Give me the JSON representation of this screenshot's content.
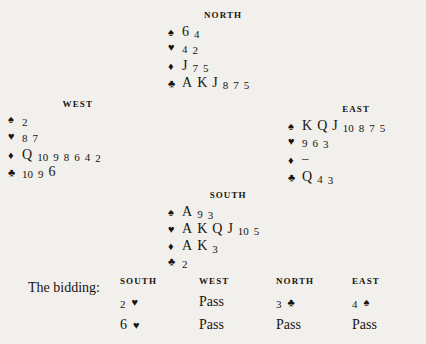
{
  "page": {
    "background_color": "#f2f0ec",
    "text_color": "#17140f"
  },
  "suits": {
    "spade": "♠",
    "heart": "♥",
    "diamond": "♦",
    "club": "♣",
    "void": "–"
  },
  "hands": {
    "north": {
      "label": "NORTH",
      "spades": [
        "6",
        "4"
      ],
      "hearts": [
        "4",
        "2"
      ],
      "diamonds": [
        "J",
        "7",
        "5"
      ],
      "clubs": [
        "A",
        "K",
        "J",
        "8",
        "7",
        "5"
      ]
    },
    "west": {
      "label": "WEST",
      "spades": [
        "2"
      ],
      "hearts": [
        "8",
        "7"
      ],
      "diamonds": [
        "Q",
        "10",
        "9",
        "8",
        "6",
        "4",
        "2"
      ],
      "clubs": [
        "10",
        "9",
        "6"
      ]
    },
    "east": {
      "label": "EAST",
      "spades": [
        "K",
        "Q",
        "J",
        "10",
        "8",
        "7",
        "5"
      ],
      "hearts": [
        "9",
        "6",
        "3"
      ],
      "diamonds": [
        "–"
      ],
      "clubs": [
        "Q",
        "4",
        "3"
      ]
    },
    "south": {
      "label": "SOUTH",
      "spades": [
        "A",
        "9",
        "3"
      ],
      "hearts": [
        "A",
        "K",
        "Q",
        "J",
        "10",
        "5"
      ],
      "diamonds": [
        "A",
        "K",
        "3"
      ],
      "clubs": [
        "2"
      ]
    }
  },
  "bidding": {
    "caption": "The bidding:",
    "columns": [
      "SOUTH",
      "WEST",
      "NORTH",
      "EAST"
    ],
    "rows": [
      {
        "south": {
          "level": "2",
          "suit": "♥"
        },
        "west": {
          "call": "Pass"
        },
        "north": {
          "level": "3",
          "suit": "♣"
        },
        "east": {
          "level": "4",
          "suit": "♠"
        }
      },
      {
        "south": {
          "level": "6",
          "suit": "♥"
        },
        "west": {
          "call": "Pass"
        },
        "north": {
          "call": "Pass"
        },
        "east": {
          "call": "Pass"
        }
      }
    ]
  }
}
